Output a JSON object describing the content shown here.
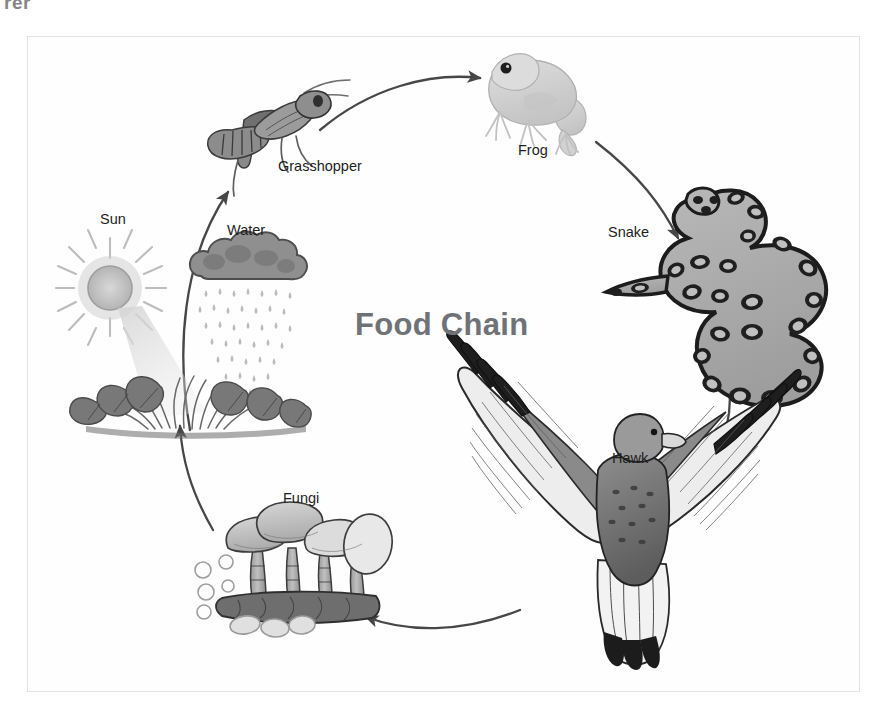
{
  "page": {
    "top_fragment": "rer",
    "background_color": "#ffffff",
    "frame_color": "#e4e4e4"
  },
  "diagram": {
    "title": "Food Chain",
    "title_color": "#6f7276",
    "label_color": "#1d1d1d",
    "arrow_color": "#4a4a4a",
    "type": "cycle",
    "direction": "clockwise",
    "nodes": [
      {
        "id": "sun",
        "label": "Sun",
        "icon": "sun-icon",
        "x": 100,
        "y": 218
      },
      {
        "id": "water",
        "label": "Water",
        "icon": "rain-cloud-icon",
        "x": 227,
        "y": 230
      },
      {
        "id": "plants",
        "label": "",
        "icon": "plants-icon",
        "x": 150,
        "y": 390
      },
      {
        "id": "grasshopper",
        "label": "Grasshopper",
        "icon": "grasshopper-icon",
        "x": 278,
        "y": 166
      },
      {
        "id": "frog",
        "label": "Frog",
        "icon": "frog-icon",
        "x": 518,
        "y": 150
      },
      {
        "id": "snake",
        "label": "Snake",
        "icon": "snake-icon",
        "x": 608,
        "y": 232
      },
      {
        "id": "hawk",
        "label": "Hawk",
        "icon": "hawk-icon",
        "x": 612,
        "y": 458
      },
      {
        "id": "fungi",
        "label": "Fungi",
        "icon": "fungi-icon",
        "x": 283,
        "y": 498
      }
    ],
    "arrows": [
      {
        "from": "plants",
        "to": "grasshopper"
      },
      {
        "from": "grasshopper",
        "to": "frog"
      },
      {
        "from": "frog",
        "to": "snake"
      },
      {
        "from": "snake",
        "to": "hawk"
      },
      {
        "from": "hawk",
        "to": "fungi"
      },
      {
        "from": "fungi",
        "to": "plants"
      }
    ]
  }
}
